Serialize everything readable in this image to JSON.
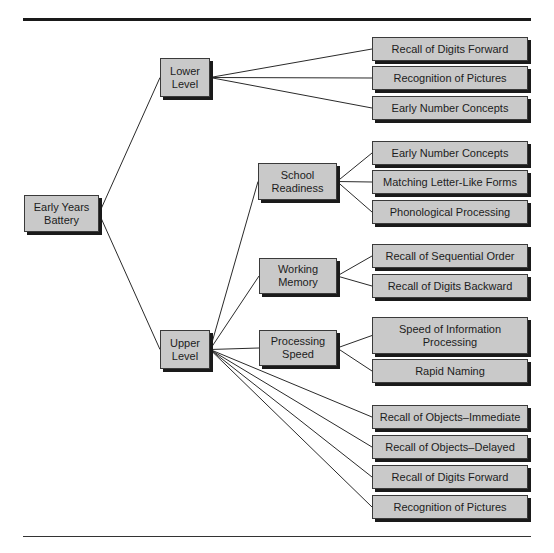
{
  "diagram": {
    "root": {
      "id": "root",
      "label": "Early Years Battery"
    },
    "levels": [
      {
        "id": "lower",
        "label": "Lower Level"
      },
      {
        "id": "upper",
        "label": "Upper Level"
      }
    ],
    "clusters": [
      {
        "id": "school",
        "label": "School Readiness"
      },
      {
        "id": "working",
        "label": "Working Memory"
      },
      {
        "id": "speed",
        "label": "Processing Speed"
      }
    ],
    "leaves": [
      {
        "id": "l1",
        "label": "Recall of Digits Forward"
      },
      {
        "id": "l2",
        "label": "Recognition of Pictures"
      },
      {
        "id": "l3",
        "label": "Early Number Concepts"
      },
      {
        "id": "l4",
        "label": "Early Number Concepts"
      },
      {
        "id": "l5",
        "label": "Matching Letter-Like Forms"
      },
      {
        "id": "l6",
        "label": "Phonological Processing"
      },
      {
        "id": "l7",
        "label": "Recall of Sequential Order"
      },
      {
        "id": "l8",
        "label": "Recall of Digits Backward"
      },
      {
        "id": "l9",
        "label": "Speed of Information Processing"
      },
      {
        "id": "l10",
        "label": "Rapid Naming"
      },
      {
        "id": "l11",
        "label": "Recall of Objects–Immediate"
      },
      {
        "id": "l12",
        "label": "Recall of Objects–Delayed"
      },
      {
        "id": "l13",
        "label": "Recall of Digits Forward"
      },
      {
        "id": "l14",
        "label": "Recognition of Pictures"
      }
    ],
    "edges": [
      [
        "root",
        "lower"
      ],
      [
        "root",
        "upper"
      ],
      [
        "lower",
        "l1"
      ],
      [
        "lower",
        "l2"
      ],
      [
        "lower",
        "l3"
      ],
      [
        "upper",
        "school"
      ],
      [
        "upper",
        "working"
      ],
      [
        "upper",
        "speed"
      ],
      [
        "school",
        "l4"
      ],
      [
        "school",
        "l5"
      ],
      [
        "school",
        "l6"
      ],
      [
        "working",
        "l7"
      ],
      [
        "working",
        "l8"
      ],
      [
        "speed",
        "l9"
      ],
      [
        "speed",
        "l10"
      ],
      [
        "upper",
        "l11"
      ],
      [
        "upper",
        "l12"
      ],
      [
        "upper",
        "l13"
      ],
      [
        "upper",
        "l14"
      ]
    ]
  }
}
